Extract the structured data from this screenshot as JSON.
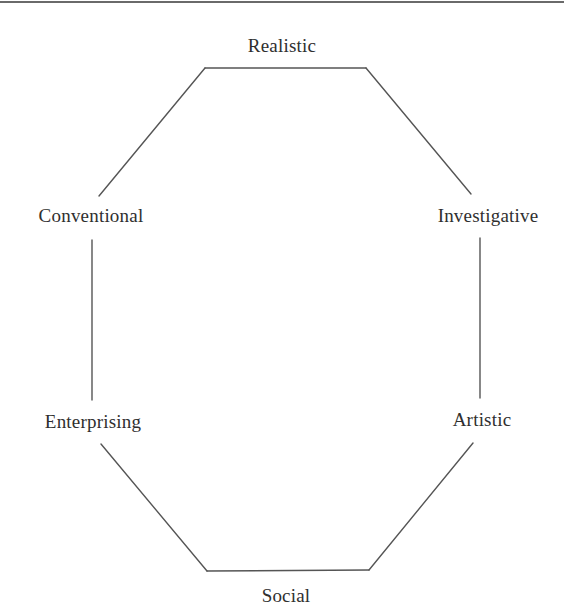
{
  "diagram": {
    "type": "riasec-hexagon",
    "line_color": "#555555",
    "text_color": "#2f2f2f",
    "nodes": [
      {
        "id": "realistic",
        "label": "Realistic",
        "x": 282,
        "y": 46
      },
      {
        "id": "investigative",
        "label": "Investigative",
        "x": 488,
        "y": 216
      },
      {
        "id": "artistic",
        "label": "Artistic",
        "x": 482,
        "y": 420
      },
      {
        "id": "social",
        "label": "Social",
        "x": 286,
        "y": 596
      },
      {
        "id": "enterprising",
        "label": "Enterprising",
        "x": 93,
        "y": 422
      },
      {
        "id": "conventional",
        "label": "Conventional",
        "x": 91,
        "y": 216
      }
    ],
    "edges": [
      {
        "name": "edge-realistic-top",
        "x1": 205,
        "y1": 68,
        "x2": 366,
        "y2": 68
      },
      {
        "name": "edge-realistic-investigative",
        "x1": 366,
        "y1": 68,
        "x2": 471,
        "y2": 194
      },
      {
        "name": "edge-investigative-artistic",
        "x1": 480,
        "y1": 238,
        "x2": 480,
        "y2": 398
      },
      {
        "name": "edge-artistic-social",
        "x1": 473,
        "y1": 443,
        "x2": 369,
        "y2": 570
      },
      {
        "name": "edge-social-bottom",
        "x1": 369,
        "y1": 570,
        "x2": 207,
        "y2": 571
      },
      {
        "name": "edge-social-enterprising",
        "x1": 207,
        "y1": 571,
        "x2": 101,
        "y2": 444
      },
      {
        "name": "edge-enterprising-conventional",
        "x1": 92,
        "y1": 400,
        "x2": 92,
        "y2": 240
      },
      {
        "name": "edge-conventional-realistic",
        "x1": 99,
        "y1": 196,
        "x2": 205,
        "y2": 68
      }
    ]
  }
}
